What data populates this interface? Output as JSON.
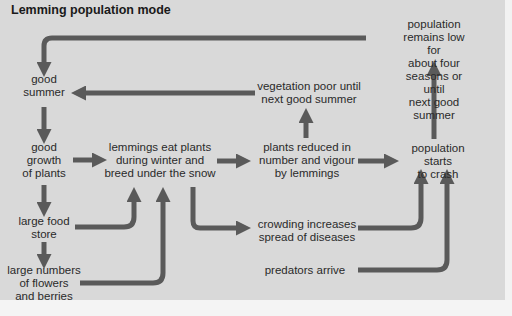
{
  "diagram": {
    "title": "Lemming population mode",
    "colors": {
      "background": "#d9d9d9",
      "arrow": "#5a5a5a",
      "text": "#2a2a2a",
      "title": "#1a1a1a"
    },
    "nodes": {
      "good_summer": "good\nsummer",
      "good_growth": "good\ngrowth\nof plants",
      "large_food_store": "large food\nstore",
      "large_numbers_flowers": "large numbers\nof flowers\nand berries",
      "lemmings_eat": "lemmings eat plants\nduring winter and\nbreed under the snow",
      "vegetation_poor": "vegetation poor until\nnext good summer",
      "plants_reduced": "plants reduced in\nnumber and vigour\nby lemmings",
      "crowding": "crowding increases\nspread of diseases",
      "predators": "predators arrive",
      "population_crash": "population starts\nto crash",
      "population_low": "population remains low for\nabout four seasons or until\nnext good summer"
    },
    "edges": [
      {
        "from": "population_low",
        "to": "good_summer"
      },
      {
        "from": "vegetation_poor",
        "to": "good_summer"
      },
      {
        "from": "good_summer",
        "to": "good_growth"
      },
      {
        "from": "good_growth",
        "to": "large_food_store"
      },
      {
        "from": "large_food_store",
        "to": "large_numbers_flowers"
      },
      {
        "from": "good_growth",
        "to": "lemmings_eat"
      },
      {
        "from": "large_food_store",
        "to": "lemmings_eat"
      },
      {
        "from": "large_numbers_flowers",
        "to": "lemmings_eat"
      },
      {
        "from": "lemmings_eat",
        "to": "plants_reduced"
      },
      {
        "from": "lemmings_eat",
        "to": "crowding"
      },
      {
        "from": "plants_reduced",
        "to": "vegetation_poor"
      },
      {
        "from": "plants_reduced",
        "to": "population_crash"
      },
      {
        "from": "crowding",
        "to": "population_crash"
      },
      {
        "from": "predators",
        "to": "population_crash"
      },
      {
        "from": "population_crash",
        "to": "population_low"
      }
    ]
  }
}
